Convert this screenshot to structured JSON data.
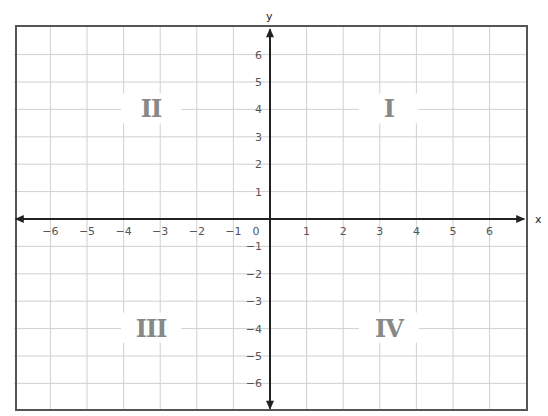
{
  "axes": {
    "x_label": "x",
    "y_label": "y",
    "x_range": [
      -7,
      7
    ],
    "y_range": [
      -7,
      7
    ],
    "x_ticks": [
      -6,
      -5,
      -4,
      -3,
      -2,
      -1,
      0,
      1,
      2,
      3,
      4,
      5,
      6
    ],
    "y_ticks": [
      -6,
      -5,
      -4,
      -3,
      -2,
      -1,
      1,
      2,
      3,
      4,
      5,
      6
    ],
    "x_tick_labels": [
      "−6",
      "−5",
      "−4",
      "−3",
      "−2",
      "−1",
      "0",
      "1",
      "2",
      "3",
      "4",
      "5",
      "6"
    ],
    "y_tick_labels": [
      "−6",
      "−5",
      "−4",
      "−3",
      "−2",
      "−1",
      "1",
      "2",
      "3",
      "4",
      "5",
      "6"
    ],
    "grid": true
  },
  "quadrants": [
    {
      "id": "I",
      "label": "I",
      "x": 3.25,
      "y": 4
    },
    {
      "id": "II",
      "label": "II",
      "x": -3.25,
      "y": 4
    },
    {
      "id": "III",
      "label": "III",
      "x": -3.25,
      "y": -4
    },
    {
      "id": "IV",
      "label": "IV",
      "x": 3.25,
      "y": -4
    }
  ],
  "colors": {
    "grid": "#d0d0d0",
    "axis": "#222222",
    "border": "#555555",
    "tick_text": "#555555",
    "quadrant_text": "#888888"
  }
}
